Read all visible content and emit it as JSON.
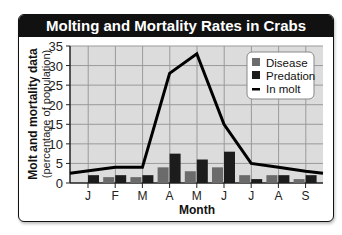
{
  "chart_data": {
    "type": "bar",
    "title": "Molting and Mortality Rates in Crabs",
    "xlabel": "Month",
    "ylabel": "Molt and mortality data",
    "ylabel_sub": "(percentage of population)",
    "categories": [
      "J",
      "F",
      "M",
      "A",
      "M",
      "J",
      "J",
      "A",
      "S"
    ],
    "yticks": [
      0,
      5,
      10,
      15,
      20,
      25,
      30,
      35
    ],
    "ylim": [
      0,
      35
    ],
    "grid": true,
    "legend_position": "upper right",
    "series": [
      {
        "name": "Disease",
        "type": "bar",
        "color": "#6b6b6b",
        "values": [
          0,
          1.5,
          1.5,
          4,
          3,
          4,
          2,
          2,
          1
        ]
      },
      {
        "name": "Predation",
        "type": "bar",
        "color": "#1c1c1c",
        "values": [
          2,
          2,
          2,
          7.5,
          6,
          8,
          1,
          2,
          2
        ]
      },
      {
        "name": "In molt",
        "type": "line",
        "color": "#000000",
        "values": [
          2.5,
          4,
          4,
          28,
          33,
          15,
          5,
          4,
          3
        ]
      }
    ]
  },
  "legend": {
    "disease": "Disease",
    "predation": "Predation",
    "molt": "In molt"
  }
}
